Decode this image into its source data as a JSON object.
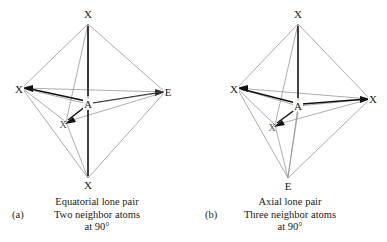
{
  "figure": {
    "panels": [
      {
        "letter": "(a)",
        "caption_line1": "Equatorial lone pair",
        "caption_line2": "Two neighbor atoms",
        "caption_line3": "at 90°",
        "vertices": [
          {
            "label": "X",
            "role": "axial-top",
            "x": 88,
            "y": 14
          },
          {
            "label": "X",
            "role": "equatorial-left",
            "x": 19,
            "y": 89
          },
          {
            "label": "E",
            "role": "equatorial-right",
            "x": 168,
            "y": 92
          },
          {
            "label": "X",
            "role": "equatorial-front",
            "x": 63,
            "y": 124
          },
          {
            "label": "X",
            "role": "axial-bottom",
            "x": 88,
            "y": 185
          },
          {
            "label": "A",
            "role": "central-atom",
            "x": 88,
            "y": 104
          }
        ]
      },
      {
        "letter": "(b)",
        "caption_line1": "Axial lone pair",
        "caption_line2": "Three neighbor atoms",
        "caption_line3": "at 90°",
        "vertices": [
          {
            "label": "X",
            "role": "axial-top",
            "x": 105,
            "y": 14
          },
          {
            "label": "X",
            "role": "equatorial-left",
            "x": 41,
            "y": 89
          },
          {
            "label": "X",
            "role": "equatorial-right",
            "x": 180,
            "y": 99
          },
          {
            "label": "X",
            "role": "equatorial-front",
            "x": 79,
            "y": 127
          },
          {
            "label": "E",
            "role": "axial-bottom",
            "x": 95,
            "y": 186
          },
          {
            "label": "A",
            "role": "central-atom",
            "x": 105,
            "y": 106
          }
        ]
      }
    ]
  },
  "colors": {
    "outline": "#8a8a8a",
    "bond": "#111111",
    "text": "#1a1a1a"
  }
}
